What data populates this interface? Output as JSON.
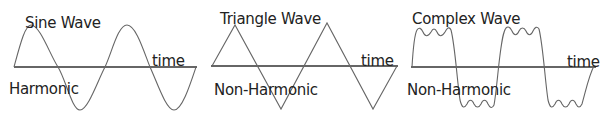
{
  "colors": {
    "axis": "#333333",
    "wave": "#666666",
    "text": "#222222",
    "background": "#ffffff"
  },
  "panels": [
    {
      "id": "sine",
      "title": "Sine Wave",
      "axis_label": "time",
      "classification": "Harmonic",
      "waveform": "sine",
      "cycles": 2
    },
    {
      "id": "triangle",
      "title": "Triangle Wave",
      "axis_label": "time",
      "classification": "Non-Harmonic",
      "waveform": "triangle",
      "cycles": 2
    },
    {
      "id": "complex",
      "title": "Complex Wave",
      "axis_label": "time",
      "classification": "Non-Harmonic",
      "waveform": "square-with-ripple",
      "cycles": 2
    }
  ]
}
